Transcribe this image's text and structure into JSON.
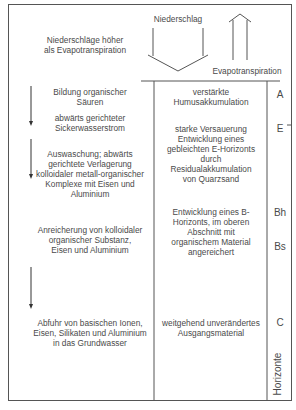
{
  "top": {
    "condition": [
      "Niederschläge höher",
      "als Evapotranspiration"
    ],
    "precip_label": "Niederschlag",
    "evap_label": "Evapotranspiration"
  },
  "left": {
    "p1": [
      "Bildung organischer",
      "Säuren"
    ],
    "p2": [
      "abwärts gerichteter",
      "Sickerwasserstrom"
    ],
    "p3": [
      "Auswaschung; abwärts",
      "gerichtete Verlagerung",
      "kolloidaler metall-organischer",
      "Komplexe mit Eisen und",
      "Aluminium"
    ],
    "p4": [
      "Anreicherung von kolloidaler",
      "organischer Substanz,",
      "Eisen und Aluminium"
    ],
    "p5": [
      "Abfuhr von basischen Ionen,",
      "Eisen, Silikaten und Aluminium",
      "in das Grundwasser"
    ]
  },
  "middle": {
    "m1": [
      "verstärkte",
      "Humusakkumulation"
    ],
    "m2": [
      "starke Versauerung",
      "Entwicklung eines",
      "gebleichten E-Horizonts",
      "durch",
      "Residualakkumulation",
      "von Quarzsand"
    ],
    "m3": [
      "Entwicklung eines B-",
      "Horizonts, im oberen",
      "Abschnitt mit",
      "organischem Material",
      "angereichert"
    ],
    "m4": [
      "weitgehend unverändertes",
      "Ausgangsmaterial"
    ]
  },
  "horizons": {
    "A": "A",
    "E": "E",
    "Bh": "Bh",
    "Bs": "Bs",
    "C": "C",
    "column_label": "Horizonte"
  }
}
